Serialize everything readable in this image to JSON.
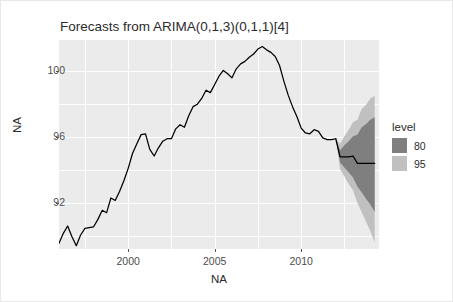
{
  "chart_data": {
    "type": "line",
    "title": "Forecasts from ARIMA(0,1,3)(0,1,1)[4]",
    "xlabel": "NA",
    "ylabel": "NA",
    "xlim": [
      1996.0,
      2014.5
    ],
    "ylim": [
      89.2,
      101.9
    ],
    "xticks": [
      2000,
      2005,
      2010
    ],
    "xticklabels": [
      "2000",
      "2005",
      "2010"
    ],
    "yticks": [
      92,
      96,
      100
    ],
    "yticklabels": [
      "92",
      "96",
      "100"
    ],
    "xminor": [
      1997.5,
      2002.5,
      2007.5,
      2012.5
    ],
    "yminor": [
      90,
      94,
      98
    ],
    "grid": true,
    "legend": {
      "title": "level",
      "position": "right",
      "entries": [
        {
          "label": "80",
          "color": "#7f7f7f"
        },
        {
          "label": "95",
          "color": "#c0c0c0"
        }
      ]
    },
    "series": [
      {
        "name": "observed",
        "color": "#000000",
        "x": [
          1996.0,
          1996.25,
          1996.5,
          1996.75,
          1997.0,
          1997.25,
          1997.5,
          1997.75,
          1998.0,
          1998.25,
          1998.5,
          1998.75,
          1999.0,
          1999.25,
          1999.5,
          1999.75,
          2000.0,
          2000.25,
          2000.5,
          2000.75,
          2001.0,
          2001.25,
          2001.5,
          2001.75,
          2002.0,
          2002.25,
          2002.5,
          2002.75,
          2003.0,
          2003.25,
          2003.5,
          2003.75,
          2004.0,
          2004.25,
          2004.5,
          2004.75,
          2005.0,
          2005.25,
          2005.5,
          2005.75,
          2006.0,
          2006.25,
          2006.5,
          2006.75,
          2007.0,
          2007.25,
          2007.5,
          2007.75,
          2008.0,
          2008.25,
          2008.5,
          2008.75,
          2009.0,
          2009.25,
          2009.5,
          2009.75,
          2010.0,
          2010.25,
          2010.5,
          2010.75,
          2011.0,
          2011.25,
          2011.5,
          2011.75,
          2012.0
        ],
        "y": [
          89.55,
          90.15,
          90.6,
          89.95,
          89.4,
          90.05,
          90.45,
          90.5,
          90.55,
          91.0,
          91.55,
          91.4,
          92.3,
          92.15,
          92.7,
          93.35,
          94.1,
          95.0,
          95.6,
          96.15,
          96.2,
          95.25,
          94.85,
          95.35,
          95.75,
          95.9,
          95.9,
          96.5,
          96.75,
          96.6,
          97.3,
          97.85,
          98.0,
          98.35,
          98.85,
          98.7,
          99.2,
          99.7,
          100.05,
          99.85,
          99.6,
          100.15,
          100.45,
          100.6,
          100.85,
          101.05,
          101.35,
          101.5,
          101.3,
          101.15,
          100.9,
          100.35,
          99.4,
          98.55,
          97.85,
          97.25,
          96.55,
          96.25,
          96.2,
          96.45,
          96.35,
          95.95,
          95.85,
          95.85,
          95.9
        ]
      },
      {
        "name": "forecast-mean",
        "color": "#000000",
        "x": [
          2012.0,
          2012.25,
          2012.5,
          2012.75,
          2013.0,
          2013.25,
          2013.5,
          2013.75,
          2014.0,
          2014.25
        ],
        "y": [
          95.9,
          94.8,
          94.8,
          94.8,
          94.85,
          94.4,
          94.4,
          94.4,
          94.4,
          94.4
        ]
      }
    ],
    "intervals": [
      {
        "level": 95,
        "color": "#c0c0c0",
        "x": [
          2012.0,
          2012.25,
          2012.5,
          2012.75,
          2013.0,
          2013.25,
          2013.5,
          2013.75,
          2014.0,
          2014.25
        ],
        "lower": [
          95.9,
          94.05,
          93.6,
          93.15,
          92.75,
          92.0,
          91.45,
          90.85,
          90.3,
          89.6
        ],
        "upper": [
          95.9,
          95.6,
          96.05,
          96.45,
          96.9,
          97.05,
          97.7,
          97.95,
          98.35,
          98.5
        ]
      },
      {
        "level": 80,
        "color": "#7f7f7f",
        "x": [
          2012.0,
          2012.25,
          2012.5,
          2012.75,
          2013.0,
          2013.25,
          2013.5,
          2013.75,
          2014.0,
          2014.25
        ],
        "lower": [
          95.9,
          94.45,
          94.15,
          93.85,
          93.55,
          93.0,
          92.65,
          92.25,
          91.9,
          91.45
        ],
        "upper": [
          95.9,
          95.2,
          95.5,
          95.75,
          96.05,
          96.15,
          96.6,
          96.8,
          97.05,
          97.2
        ]
      }
    ]
  }
}
